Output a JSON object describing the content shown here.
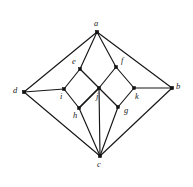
{
  "figure": {
    "width": 193,
    "height": 187,
    "background_color": "#ffffff",
    "line_color": "#161616",
    "vertex_color": "#111111"
  },
  "graph": {
    "vertex_count": 11,
    "edge_count": 20,
    "vertices": [
      {
        "id": "a",
        "label": "a",
        "x": 97,
        "y": 32,
        "label_x": 94,
        "label_y": 19,
        "dot_size": 3.1
      },
      {
        "id": "b",
        "label": "b",
        "x": 172,
        "y": 88,
        "label_x": 176,
        "label_y": 82,
        "dot_size": 3.1
      },
      {
        "id": "c",
        "label": "c",
        "x": 100,
        "y": 156,
        "label_x": 97,
        "label_y": 160,
        "dot_size": 3.1
      },
      {
        "id": "d",
        "label": "d",
        "x": 24,
        "y": 92,
        "label_x": 13,
        "label_y": 86,
        "dot_size": 3.1
      },
      {
        "id": "e",
        "label": "e",
        "x": 80,
        "y": 69,
        "label_x": 72,
        "label_y": 57,
        "dot_size": 2.7
      },
      {
        "id": "f",
        "label": "f",
        "x": 116,
        "y": 67,
        "label_x": 121,
        "label_y": 56,
        "dot_size": 2.7
      },
      {
        "id": "g",
        "label": "g",
        "x": 118,
        "y": 107,
        "label_x": 124,
        "label_y": 106,
        "dot_size": 2.7
      },
      {
        "id": "h",
        "label": "h",
        "x": 79,
        "y": 108,
        "label_x": 73,
        "label_y": 111,
        "dot_size": 2.7
      },
      {
        "id": "i",
        "label": "i",
        "x": 64,
        "y": 89,
        "label_x": 60,
        "label_y": 92,
        "dot_size": 2.7
      },
      {
        "id": "j",
        "label": "j",
        "x": 99,
        "y": 88,
        "label_x": 96,
        "label_y": 92,
        "dot_size": 2.7
      },
      {
        "id": "k",
        "label": "k",
        "x": 134,
        "y": 88,
        "label_x": 135,
        "label_y": 92,
        "dot_size": 2.7
      }
    ],
    "edges": [
      {
        "from": "a",
        "to": "d"
      },
      {
        "from": "a",
        "to": "b"
      },
      {
        "from": "a",
        "to": "e"
      },
      {
        "from": "a",
        "to": "f"
      },
      {
        "from": "d",
        "to": "i"
      },
      {
        "from": "d",
        "to": "c"
      },
      {
        "from": "b",
        "to": "k"
      },
      {
        "from": "b",
        "to": "c"
      },
      {
        "from": "e",
        "to": "i"
      },
      {
        "from": "e",
        "to": "j"
      },
      {
        "from": "f",
        "to": "j"
      },
      {
        "from": "f",
        "to": "k"
      },
      {
        "from": "i",
        "to": "h"
      },
      {
        "from": "j",
        "to": "h"
      },
      {
        "from": "j",
        "to": "g"
      },
      {
        "from": "k",
        "to": "g"
      },
      {
        "from": "h",
        "to": "c"
      },
      {
        "from": "g",
        "to": "c"
      },
      {
        "from": "j",
        "to": "c"
      },
      {
        "from": "h",
        "to": "j"
      }
    ]
  }
}
